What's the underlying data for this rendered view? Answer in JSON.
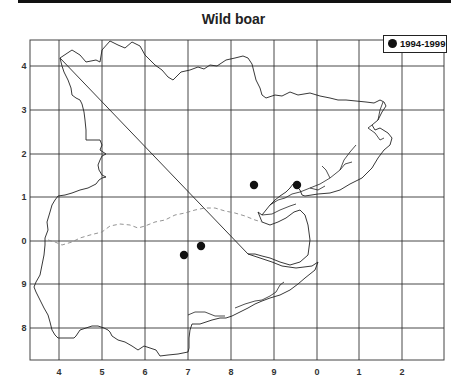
{
  "map": {
    "title": "Wild boar",
    "legend": [
      {
        "symbol": "filled-circle",
        "label": "1994-1999",
        "color": "#111111"
      }
    ],
    "x_ticks": [
      {
        "label": "4",
        "x": 59
      },
      {
        "label": "5",
        "x": 102
      },
      {
        "label": "6",
        "x": 145
      },
      {
        "label": "7",
        "x": 188
      },
      {
        "label": "8",
        "x": 231
      },
      {
        "label": "9",
        "x": 274
      },
      {
        "label": "0",
        "x": 317
      },
      {
        "label": "1",
        "x": 359
      },
      {
        "label": "2",
        "x": 402
      }
    ],
    "y_ticks": [
      {
        "label": "4",
        "y": 66
      },
      {
        "label": "3",
        "y": 110
      },
      {
        "label": "2",
        "y": 154
      },
      {
        "label": "1",
        "y": 197
      },
      {
        "label": "0",
        "y": 241
      },
      {
        "label": "9",
        "y": 284
      },
      {
        "label": "8",
        "y": 328
      }
    ],
    "records": [
      {
        "period": "1994-1999",
        "x": 254,
        "y": 185
      },
      {
        "period": "1994-1999",
        "x": 297,
        "y": 185
      },
      {
        "period": "1994-1999",
        "x": 201,
        "y": 246
      },
      {
        "period": "1994-1999",
        "x": 184,
        "y": 255
      }
    ]
  }
}
